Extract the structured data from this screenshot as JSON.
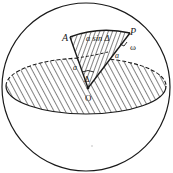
{
  "diagram": {
    "labels": {
      "point_a": "A",
      "point_p": "P",
      "center": "O",
      "arc_length": "a sin Δ",
      "angle_omega": "ω",
      "radius_right": "a",
      "radius_left": "a",
      "angle_delta": "Δ"
    },
    "colors": {
      "stroke": "#1a1a1a",
      "background": "#ffffff"
    }
  }
}
